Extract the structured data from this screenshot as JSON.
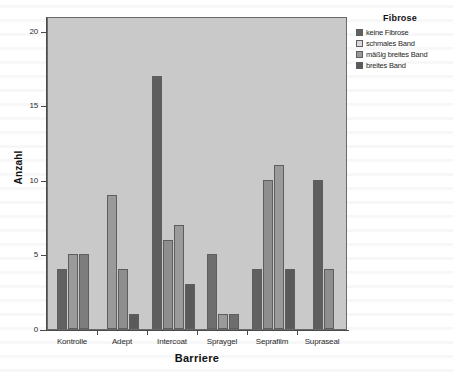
{
  "chart_data": {
    "type": "bar",
    "title": "",
    "xlabel": "Barriere",
    "ylabel": "Anzahl",
    "categories": [
      "Kontrolle",
      "Adept",
      "Intercoat",
      "Spraygel",
      "Seprafilm",
      "Supraseal"
    ],
    "ylim": [
      0,
      21
    ],
    "yticks": [
      0,
      5,
      10,
      15,
      20
    ],
    "ytick_labels": [
      "0",
      "5",
      "10",
      "15",
      "20"
    ],
    "grid": false,
    "legend_position": "right",
    "legend_title": "Fibrose",
    "series": [
      {
        "name": "keine Fibrose",
        "color": "#616161",
        "values": [
          4,
          null,
          17,
          5,
          4,
          10
        ]
      },
      {
        "name": "schmales Band",
        "color": "#d2d2d2",
        "values": [
          5,
          9,
          6,
          1,
          10,
          null
        ]
      },
      {
        "name": "mäßig breites Band",
        "color": "#9a9a9a",
        "values": [
          5,
          4,
          7,
          1,
          11,
          4
        ]
      },
      {
        "name": "breites Band",
        "color": "#5a5a5a",
        "values": [
          null,
          1,
          3,
          null,
          4,
          null
        ]
      }
    ],
    "bars": [
      {
        "category": "Kontrolle",
        "series": "keine Fibrose",
        "value": 4,
        "color": "#616161"
      },
      {
        "category": "Kontrolle",
        "series": "schmales Band",
        "value": 5,
        "color": "#9a9a9a"
      },
      {
        "category": "Kontrolle",
        "series": "mäßig breites Band",
        "value": 5,
        "color": "#7d7d7d"
      },
      {
        "category": "Adept",
        "series": "schmales Band",
        "value": 9,
        "color": "#9a9a9a"
      },
      {
        "category": "Adept",
        "series": "mäßig breites Band",
        "value": 4,
        "color": "#8e8e8e"
      },
      {
        "category": "Adept",
        "series": "breites Band",
        "value": 1,
        "color": "#5a5a5a"
      },
      {
        "category": "Intercoat",
        "series": "keine Fibrose",
        "value": 17,
        "color": "#5e5e5e"
      },
      {
        "category": "Intercoat",
        "series": "schmales Band",
        "value": 6,
        "color": "#8e8e8e"
      },
      {
        "category": "Intercoat",
        "series": "mäßig breites Band",
        "value": 7,
        "color": "#9a9a9a"
      },
      {
        "category": "Intercoat",
        "series": "breites Band",
        "value": 3,
        "color": "#5a5a5a"
      },
      {
        "category": "Spraygel",
        "series": "keine Fibrose",
        "value": 5,
        "color": "#6e6e6e"
      },
      {
        "category": "Spraygel",
        "series": "schmales Band",
        "value": 1,
        "color": "#9a9a9a"
      },
      {
        "category": "Spraygel",
        "series": "mäßig breites Band",
        "value": 1,
        "color": "#6e6e6e"
      },
      {
        "category": "Seprafilm",
        "series": "keine Fibrose",
        "value": 4,
        "color": "#616161"
      },
      {
        "category": "Seprafilm",
        "series": "schmales Band",
        "value": 10,
        "color": "#8e8e8e"
      },
      {
        "category": "Seprafilm",
        "series": "mäßig breites Band",
        "value": 11,
        "color": "#9a9a9a"
      },
      {
        "category": "Seprafilm",
        "series": "breites Band",
        "value": 4,
        "color": "#5a5a5a"
      },
      {
        "category": "Supraseal",
        "series": "keine Fibrose",
        "value": 10,
        "color": "#5e5e5e"
      },
      {
        "category": "Supraseal",
        "series": "mäßig breites Band",
        "value": 4,
        "color": "#8e8e8e"
      }
    ]
  },
  "axes": {
    "y": {
      "title": "Anzahl",
      "ticks": [
        "20",
        "15",
        "10",
        "5",
        "0"
      ]
    },
    "x": {
      "title": "Barriere",
      "ticks": [
        "Kontrolle",
        "Adept",
        "Intercoat",
        "Spraygel",
        "Seprafilm",
        "Supraseal"
      ]
    }
  },
  "legend": {
    "title": "Fibrose",
    "items": [
      {
        "label": "keine Fibrose",
        "color": "#616161"
      },
      {
        "label": "schmales Band",
        "color": "#d9d9d9"
      },
      {
        "label": "mäßig breites Band",
        "color": "#9a9a9a"
      },
      {
        "label": "breites Band",
        "color": "#5a5a5a"
      }
    ]
  }
}
